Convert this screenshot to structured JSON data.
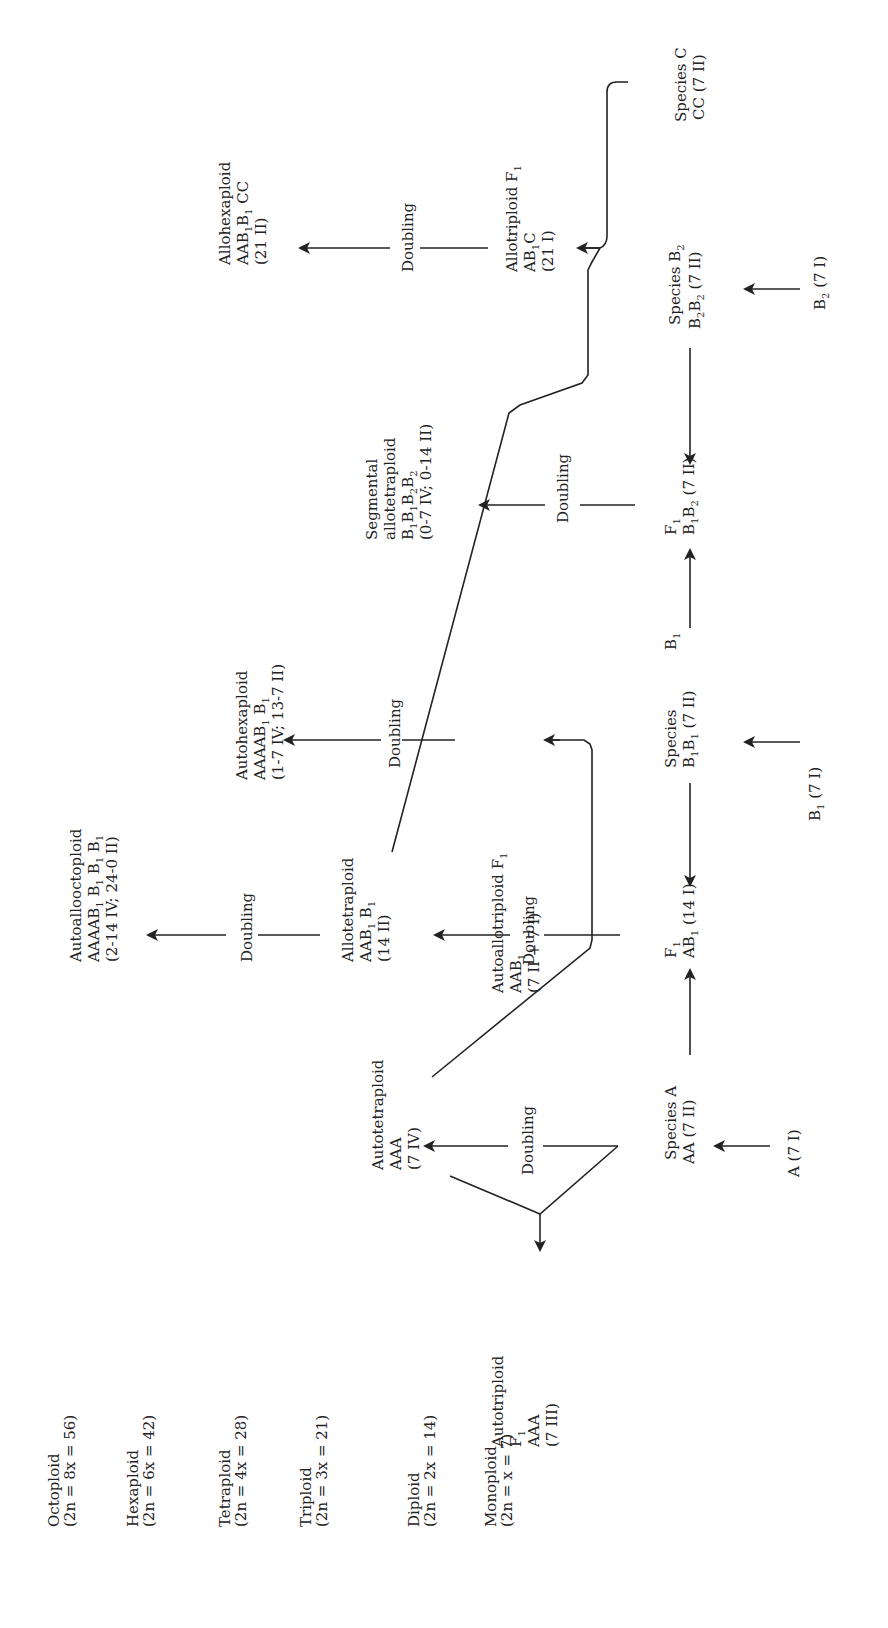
{
  "diagram": {
    "orientation": "rotated-90-ccw",
    "ploidy_levels": [
      {
        "name": "Octoploid",
        "formula": "(2n = 8x = 56)"
      },
      {
        "name": "Hexaploid",
        "formula": "(2n = 6x = 42)"
      },
      {
        "name": "Tetraploid",
        "formula": "(2n = 4x = 28)"
      },
      {
        "name": "Triploid",
        "formula": "(2n = 3x = 21)"
      },
      {
        "name": "Diploid",
        "formula": "(2n = 2x = 14)"
      },
      {
        "name": "Monoploid",
        "formula": "(2n = x = 7)"
      }
    ],
    "nodes": {
      "a_mono": {
        "line1": "A (7 I)"
      },
      "b1_mono": {
        "line1": "B",
        "sub1": "1",
        "rest1": " (7 I)"
      },
      "b2_mono": {
        "line1": "B",
        "sub1": "2",
        "rest1": " (7 I)"
      },
      "species_a": {
        "line1": "Species A",
        "line2": "AA (7 II)"
      },
      "species_b1": {
        "line1": "Species",
        "line2a": "B",
        "line2s1": "1",
        "line2b": "B",
        "line2s2": "1",
        "line2c": " (7 II)"
      },
      "b1_label": {
        "text": "B",
        "sub": "1"
      },
      "species_b2": {
        "line1a": "Species B",
        "line1s": "2",
        "line2a": "B",
        "line2s1": "2",
        "line2b": "B",
        "line2s2": "2",
        "line2c": " (7 II)"
      },
      "species_c": {
        "line1": "Species C",
        "line2": "CC (7 II)"
      },
      "f1_ab1": {
        "line1a": "F",
        "line1s": "1",
        "line2a": "AB",
        "line2s": "1",
        "line2b": " (14 I)"
      },
      "f1_b1b2": {
        "line1a": "F",
        "line1s": "1",
        "line2a": "B",
        "line2s1": "1",
        "line2b": "B",
        "line2s2": "2",
        "line2c": " (7 II)"
      },
      "autotriploid": {
        "line1": "Autotriploid",
        "line2a": "F",
        "line2s": "1",
        "line3": "AAA",
        "line4": "(7 III)"
      },
      "autotetraploid": {
        "line1": "Autotetraploid",
        "line2": "AAA",
        "line3": "(7 IV)"
      },
      "allotetraploid": {
        "line1": "Allotetraploid",
        "line2a": "AAB",
        "line2s1": "1",
        "line2b": " B",
        "line2s2": "1",
        "line3": "(14 II)"
      },
      "autoallotriploid": {
        "line1a": "Autoallotriploid F",
        "line1s": "1",
        "line2a": "AAB",
        "line2s": "1",
        "line3": "(7 II + 7 I)"
      },
      "segmental": {
        "line1": "Segmental",
        "line2": "allotetraploid",
        "line3a": "B",
        "line3s1": "1",
        "line3b": "B",
        "line3s2": "1",
        "line3c": "B",
        "line3s3": "2",
        "line3d": "B",
        "line3s4": "2",
        "line4": "(0-7 IV; 0-14 II)"
      },
      "allotriploid": {
        "line1a": "Allotriploid F",
        "line1s": "1",
        "line2a": "AB",
        "line2s": "1",
        "line2b": "C",
        "line3": "(21 I)"
      },
      "autoalloctoploid": {
        "line1": "Autoallooctoploid",
        "line2a": "AAAAB",
        "line2s1": "1",
        "line2b": " B",
        "line2s2": "1",
        "line2c": " B",
        "line2s3": "1",
        "line2d": " B",
        "line2s4": "1",
        "line3": "(2-14 IV; 24-0 II)"
      },
      "autohexaploid": {
        "line1": "Autohexaploid",
        "line2a": "AAAAB",
        "line2s1": "1",
        "line2b": " B",
        "line2s2": "1",
        "line3": "(1-7 IV; 13-7 II)"
      },
      "allohexaploid": {
        "line1": "Allohexaploid",
        "line2a": "AAB",
        "line2s1": "1",
        "line2b": "B",
        "line2s2": "1",
        "line2c": " CC",
        "line3": "(21 II)"
      }
    },
    "edge_labels": {
      "doubling": "Doubling"
    }
  }
}
